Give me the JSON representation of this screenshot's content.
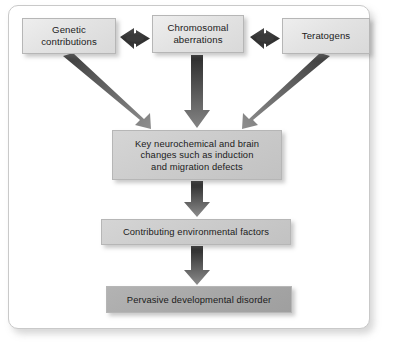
{
  "figure": {
    "background": "#ffffff",
    "frame_border_color": "#c9c9c9"
  },
  "nodes": [
    {
      "id": "genetic-contributions",
      "label": "Genetic\ncontributions",
      "tone": "light",
      "font_size": 9.6,
      "x": 22,
      "y": 18,
      "w": 94,
      "h": 36
    },
    {
      "id": "chromosomal-aberrations",
      "label": "Chromosomal\naberrations",
      "tone": "light",
      "font_size": 9.6,
      "x": 152,
      "y": 15,
      "w": 92,
      "h": 38
    },
    {
      "id": "teratogens",
      "label": "Teratogens",
      "tone": "light",
      "font_size": 9.6,
      "x": 282,
      "y": 18,
      "w": 88,
      "h": 36
    },
    {
      "id": "key-neurochemical-changes",
      "label": "Key neurochemical and brain\nchanges such as induction\nand migration defects",
      "tone": "mid",
      "font_size": 9.4,
      "x": 112,
      "y": 130,
      "w": 170,
      "h": 50
    },
    {
      "id": "contributing-environmental-factors",
      "label": "Contributing environmental factors",
      "tone": "mid",
      "font_size": 9.4,
      "x": 101,
      "y": 219,
      "w": 190,
      "h": 26
    },
    {
      "id": "pervasive-developmental-disorder",
      "label": "Pervasive developmental disorder",
      "tone": "dark",
      "font_size": 9.4,
      "x": 106,
      "y": 286,
      "w": 186,
      "h": 27
    }
  ],
  "connectors": [
    {
      "id": "genetic-to-chromosomal",
      "kind": "double-arrow",
      "from": "genetic-contributions",
      "to": "chromosomal-aberrations",
      "color": "#3a3a3a"
    },
    {
      "id": "chromosomal-to-teratogens",
      "kind": "double-arrow",
      "from": "chromosomal-aberrations",
      "to": "teratogens",
      "color": "#3a3a3a"
    },
    {
      "id": "genetic-to-key-changes",
      "kind": "arrow-diagonal",
      "from": "genetic-contributions",
      "to": "key-neurochemical-changes",
      "color": "#5a5a5a"
    },
    {
      "id": "chromosomal-to-key-changes",
      "kind": "arrow-down",
      "from": "chromosomal-aberrations",
      "to": "key-neurochemical-changes",
      "color": "#3f3f3f"
    },
    {
      "id": "teratogens-to-key-changes",
      "kind": "arrow-diagonal",
      "from": "teratogens",
      "to": "key-neurochemical-changes",
      "color": "#5a5a5a"
    },
    {
      "id": "key-changes-to-environmental-factors",
      "kind": "arrow-down",
      "from": "key-neurochemical-changes",
      "to": "contributing-environmental-factors",
      "color": "#3f3f3f"
    },
    {
      "id": "environmental-factors-to-disorder",
      "kind": "arrow-down",
      "from": "contributing-environmental-factors",
      "to": "pervasive-developmental-disorder",
      "color": "#3f3f3f"
    }
  ]
}
